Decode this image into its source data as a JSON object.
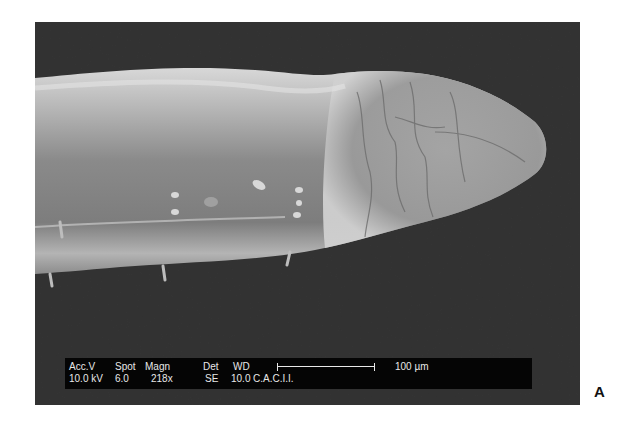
{
  "figure": {
    "panel_label": "A",
    "image_description": "Scanning electron micrograph of a nematode anterior end (head region) against dark background"
  },
  "databar": {
    "headers": {
      "acc_v": "Acc.V",
      "spot": "Spot",
      "magn": "Magn",
      "det": "Det",
      "wd": "WD"
    },
    "values": {
      "acc_v": "10.0 kV",
      "spot": "6.0",
      "magn": "218x",
      "det": "SE",
      "wd": "10.0",
      "facility": "C.A.C.I.I."
    },
    "scale_bar_label": "100 µm"
  },
  "colors": {
    "background": "#2a2a2a",
    "databar": "#050505",
    "text": "#e8e8e8",
    "specimen_light": "#c8c8c8",
    "specimen_mid": "#8f8f8f"
  }
}
